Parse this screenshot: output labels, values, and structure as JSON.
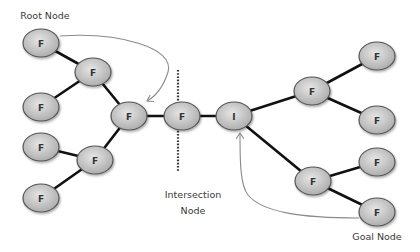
{
  "diagram": {
    "labels": {
      "root": "Root Node",
      "intersection_line1": "Intersection",
      "intersection_line2": "Node",
      "goal": "Goal Node"
    },
    "colors": {
      "node_fill_light": "#e6e6e6",
      "node_fill_dark": "#a9a9a9",
      "node_stroke": "#555555",
      "edge": "#111111",
      "arrow": "#8a8a8a",
      "divider": "#333333"
    },
    "nodes": [
      {
        "id": "root",
        "label": "F",
        "x": 41,
        "y": 43
      },
      {
        "id": "n2",
        "label": "F",
        "x": 93,
        "y": 72
      },
      {
        "id": "n3",
        "label": "F",
        "x": 41,
        "y": 107
      },
      {
        "id": "n4",
        "label": "F",
        "x": 129,
        "y": 116
      },
      {
        "id": "n5",
        "label": "F",
        "x": 41,
        "y": 147
      },
      {
        "id": "n6",
        "label": "F",
        "x": 95,
        "y": 160
      },
      {
        "id": "n7",
        "label": "F",
        "x": 41,
        "y": 198
      },
      {
        "id": "n8",
        "label": "F",
        "x": 182,
        "y": 116
      },
      {
        "id": "intersection",
        "label": "I",
        "x": 234,
        "y": 116
      },
      {
        "id": "n10",
        "label": "F",
        "x": 312,
        "y": 91
      },
      {
        "id": "n11",
        "label": "F",
        "x": 377,
        "y": 56
      },
      {
        "id": "n12",
        "label": "F",
        "x": 377,
        "y": 120
      },
      {
        "id": "n13",
        "label": "F",
        "x": 313,
        "y": 181
      },
      {
        "id": "n14",
        "label": "F",
        "x": 377,
        "y": 162
      },
      {
        "id": "goal",
        "label": "F",
        "x": 377,
        "y": 212
      }
    ],
    "edges": [
      [
        "root",
        "n2"
      ],
      [
        "n2",
        "n3"
      ],
      [
        "n2",
        "n4"
      ],
      [
        "n4",
        "n6"
      ],
      [
        "n6",
        "n5"
      ],
      [
        "n6",
        "n7"
      ],
      [
        "n4",
        "n8"
      ],
      [
        "n8",
        "intersection"
      ],
      [
        "intersection",
        "n10"
      ],
      [
        "n10",
        "n11"
      ],
      [
        "n10",
        "n12"
      ],
      [
        "intersection",
        "n13"
      ],
      [
        "n13",
        "n14"
      ],
      [
        "n13",
        "goal"
      ]
    ]
  }
}
